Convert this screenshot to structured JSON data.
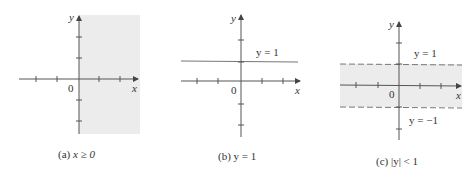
{
  "figure": {
    "panels": [
      {
        "id": "a",
        "caption": "(a) x ≥ 0",
        "caption_prefix": "(a) ",
        "caption_math": "x ≥ 0",
        "region": "half-plane x >= 0 shaded",
        "axis_x_label": "x",
        "axis_y_label": "y",
        "origin_label": "0"
      },
      {
        "id": "b",
        "caption": "(b) y = 1",
        "caption_prefix": "(b) ",
        "caption_math": "y = 1",
        "line_label": "y = 1",
        "axis_x_label": "x",
        "axis_y_label": "y",
        "origin_label": "0"
      },
      {
        "id": "c",
        "caption": "(c) |y| < 1",
        "caption_prefix": "(c) ",
        "caption_math": "|y| < 1",
        "upper_label": "y = 1",
        "lower_label": "y = −1",
        "axis_x_label": "x",
        "axis_y_label": "y",
        "origin_label": "0"
      }
    ],
    "colors": {
      "shade": "#ececec",
      "axis": "#555555",
      "line": "#777777",
      "text": "#333333"
    }
  }
}
